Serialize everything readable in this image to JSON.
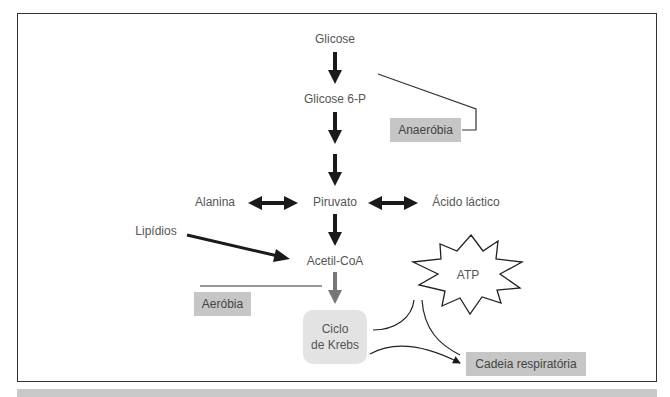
{
  "diagram": {
    "nodes": {
      "glicose": "Glicose",
      "glicose6p": "Glicose 6-P",
      "piruvato": "Piruvato",
      "alanina": "Alanina",
      "acido_lactico": "Ácido láctico",
      "lipidios": "Lipídios",
      "acetil_coa": "Acetil-CoA",
      "ciclo_krebs_line1": "Ciclo",
      "ciclo_krebs_line2": "de Krebs",
      "atp": "ATP",
      "cadeia_respiratoria": "Cadeia respiratória"
    },
    "phases": {
      "anaerobia": "Anaeróbia",
      "aerobia": "Aeróbia"
    },
    "colors": {
      "label_box": "#c6c6c6",
      "krebs_box": "#e3e3e3",
      "arrow_dark": "#1a1a1a",
      "arrow_gray": "#777777",
      "text": "#555555",
      "footer_bar": "#c8c8c8"
    }
  }
}
